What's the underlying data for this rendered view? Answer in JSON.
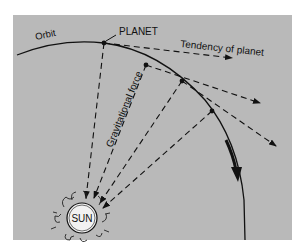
{
  "diagram": {
    "type": "orbital-mechanics-illustration",
    "colors": {
      "background": "#ffffff",
      "panel": "#b9b9b9",
      "ink": "#111111",
      "sun_fill": "#f2f2f2"
    },
    "labels": {
      "orbit": "Orbit",
      "planet": "PLANET",
      "tendency": "Tendency of planet",
      "gravity": "Gravitational force",
      "sun": "SUN"
    },
    "elements": [
      {
        "id": "orbit-path",
        "kind": "curve",
        "description": "Solid curved orbit path from upper-left sweeping to lower-right, with a bold arrow indicating direction of motion"
      },
      {
        "id": "planet-positions",
        "kind": "points",
        "count": 4
      },
      {
        "id": "tangent-arrows",
        "kind": "dashed-arrows",
        "count": 3,
        "description": "Dashed tangent lines showing the planet's tendency to continue in a straight line"
      },
      {
        "id": "gravity-arrows",
        "kind": "dashed-arrows",
        "count": 4,
        "description": "Dashed lines from planet positions pointing toward the Sun"
      },
      {
        "id": "sun",
        "kind": "circle",
        "description": "Sun drawn as a circle with flame-like corona"
      }
    ]
  }
}
